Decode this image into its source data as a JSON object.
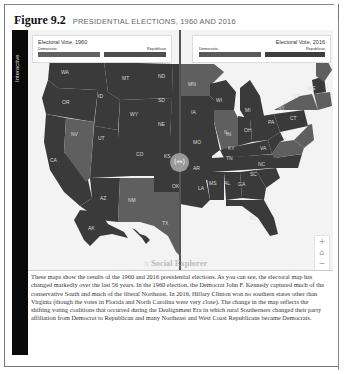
{
  "figure": {
    "number": "Figure 9.2",
    "title": "PRESIDENTIAL ELECTIONS, 1960 AND 2016"
  },
  "side_tab": {
    "label": "Interactive"
  },
  "legends": {
    "left": {
      "title": "Electoral Vote, 1960",
      "dem_label": "Democratic",
      "rep_label": "Republican"
    },
    "right": {
      "title": "Electoral Vote, 2016",
      "dem_label": "Democratic",
      "rep_label": "Republican"
    }
  },
  "colors": {
    "democratic": "#5f5f5f",
    "republican": "#3a3a3a",
    "map_background": "#f3f3f3",
    "side_tab": "#0a0a0a"
  },
  "map": {
    "divider_handle_icon": "swap-arrows-icon",
    "divider_handle_glyph": "⟨↔⟩",
    "left_states": [
      {
        "id": "WA",
        "party": "R"
      },
      {
        "id": "OR",
        "party": "R"
      },
      {
        "id": "CA",
        "party": "R"
      },
      {
        "id": "ID",
        "party": "R"
      },
      {
        "id": "NV",
        "party": "D"
      },
      {
        "id": "MT",
        "party": "R"
      },
      {
        "id": "WY",
        "party": "R"
      },
      {
        "id": "UT",
        "party": "R"
      },
      {
        "id": "AZ",
        "party": "R"
      },
      {
        "id": "CO",
        "party": "R"
      },
      {
        "id": "NM",
        "party": "D"
      },
      {
        "id": "ND",
        "party": "R"
      },
      {
        "id": "SD",
        "party": "R"
      },
      {
        "id": "NE",
        "party": "R"
      },
      {
        "id": "KS",
        "party": "R"
      },
      {
        "id": "OK",
        "party": "R"
      },
      {
        "id": "TX",
        "party": "D"
      },
      {
        "id": "AK",
        "party": "R"
      }
    ],
    "right_states": [
      {
        "id": "MN",
        "party": "D"
      },
      {
        "id": "IA",
        "party": "R"
      },
      {
        "id": "MO",
        "party": "R"
      },
      {
        "id": "AR",
        "party": "R"
      },
      {
        "id": "LA",
        "party": "R"
      },
      {
        "id": "WI",
        "party": "R"
      },
      {
        "id": "IL",
        "party": "D"
      },
      {
        "id": "MI",
        "party": "R"
      },
      {
        "id": "IN",
        "party": "R"
      },
      {
        "id": "OH",
        "party": "R"
      },
      {
        "id": "KY",
        "party": "R"
      },
      {
        "id": "TN",
        "party": "R"
      },
      {
        "id": "MS",
        "party": "R"
      },
      {
        "id": "AL",
        "party": "R"
      },
      {
        "id": "GA",
        "party": "R"
      },
      {
        "id": "FL",
        "party": "R"
      },
      {
        "id": "SC",
        "party": "R"
      },
      {
        "id": "NC",
        "party": "R"
      },
      {
        "id": "VA",
        "party": "D"
      },
      {
        "id": "PA",
        "party": "R"
      },
      {
        "id": "NY",
        "party": "D"
      },
      {
        "id": "VT",
        "party": "D"
      },
      {
        "id": "CT",
        "party": "D"
      },
      {
        "id": "ME",
        "party": "D"
      }
    ]
  },
  "branding": {
    "logo_text": "Social Explorer",
    "logo_icon": "dots-icon"
  },
  "zoom_controls": {
    "zoom_in": "+",
    "home": "⌂",
    "zoom_out": "−"
  },
  "caption": "These maps show the results of the 1960 and 2016 presidential elections. As you can see, the electoral map has changed markedly over the last 56 years. In the 1960 election, the Democrat John F. Kennedy captured much of the conservative South and much of the liberal Northeast. In 2016, Hillary Clinton won no southern states other than Virginia (though the votes in Florida and North Carolina were very close). The change in the map reflects the shifting voting coalitions that occurred during the Dealignment Era in which rural Southerners changed their party affiliation from Democrat to Republican and many Northeast and West Coast Republicans became Democrats."
}
